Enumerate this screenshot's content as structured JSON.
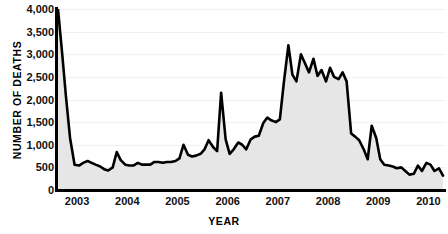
{
  "chart_data": {
    "type": "line",
    "title": "",
    "subtitle": "",
    "xlabel": "YEAR",
    "ylabel": "NUMBER OF DEATHS",
    "xlim": [
      2002.6,
      2010.35
    ],
    "ylim": [
      0,
      4000
    ],
    "grid": true,
    "legend": "none",
    "fill": "area below line, light gray",
    "line_color": "#000000",
    "fill_color": "#e6e6e6",
    "gridline_color": "#f1f1f1",
    "y_ticks": [
      0,
      500,
      1000,
      1500,
      2000,
      2500,
      3000,
      3500,
      4000
    ],
    "y_tick_labels": [
      "0",
      "500",
      "1,000",
      "1,500",
      "2,000",
      "2,500",
      "3,000",
      "3,500",
      "4,000"
    ],
    "x_ticks": [
      2003,
      2004,
      2005,
      2006,
      2007,
      2008,
      2009,
      2010
    ],
    "x_tick_labels": [
      "2003",
      "2004",
      "2005",
      "2006",
      "2007",
      "2008",
      "2009",
      "2010"
    ],
    "series": [
      {
        "name": "Number of deaths",
        "x": [
          2002.62,
          2002.7,
          2002.78,
          2002.86,
          2002.95,
          2003.04,
          2003.12,
          2003.21,
          2003.29,
          2003.37,
          2003.46,
          2003.54,
          2003.62,
          2003.71,
          2003.79,
          2003.87,
          2003.96,
          2004.04,
          2004.12,
          2004.21,
          2004.29,
          2004.37,
          2004.46,
          2004.54,
          2004.62,
          2004.71,
          2004.79,
          2004.87,
          2004.96,
          2005.04,
          2005.12,
          2005.21,
          2005.29,
          2005.37,
          2005.46,
          2005.54,
          2005.62,
          2005.71,
          2005.79,
          2005.87,
          2005.96,
          2006.04,
          2006.12,
          2006.21,
          2006.29,
          2006.37,
          2006.46,
          2006.54,
          2006.62,
          2006.71,
          2006.79,
          2006.87,
          2006.96,
          2007.04,
          2007.12,
          2007.21,
          2007.29,
          2007.37,
          2007.46,
          2007.54,
          2007.62,
          2007.71,
          2007.79,
          2007.87,
          2007.96,
          2008.04,
          2008.12,
          2008.21,
          2008.29,
          2008.37,
          2008.46,
          2008.54,
          2008.62,
          2008.71,
          2008.79,
          2008.87,
          2008.96,
          2009.04,
          2009.12,
          2009.21,
          2009.29,
          2009.37,
          2009.46,
          2009.54,
          2009.62,
          2009.71,
          2009.79,
          2009.87,
          2009.96,
          2010.04,
          2010.12,
          2010.21,
          2010.29
        ],
        "values": [
          4000,
          3050,
          2050,
          1150,
          560,
          540,
          600,
          640,
          600,
          560,
          520,
          460,
          430,
          500,
          840,
          660,
          560,
          540,
          540,
          600,
          560,
          560,
          560,
          620,
          620,
          600,
          620,
          620,
          640,
          700,
          1000,
          780,
          740,
          760,
          800,
          900,
          1100,
          950,
          860,
          2150,
          1120,
          800,
          900,
          1050,
          1000,
          900,
          1120,
          1180,
          1200,
          1480,
          1600,
          1540,
          1500,
          1560,
          2380,
          3200,
          2550,
          2400,
          3000,
          2800,
          2600,
          2900,
          2520,
          2650,
          2400,
          2700,
          2500,
          2450,
          2600,
          2400,
          1250,
          1180,
          1100,
          900,
          680,
          1420,
          1150,
          680,
          560,
          540,
          520,
          480,
          500,
          420,
          340,
          360,
          540,
          420,
          600,
          560,
          420,
          480,
          320
        ]
      }
    ],
    "annotations": []
  }
}
